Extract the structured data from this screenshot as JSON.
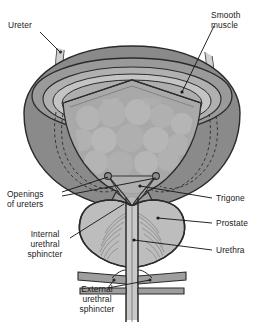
{
  "figure": {
    "style": "grayscale medical illustration",
    "background_color": "#ffffff"
  },
  "colors": {
    "outline": "#2b2b2b",
    "outer_wall": "#8a8a8a",
    "muscle_rim": "#9a9a9a",
    "rim_highlight": "#c4c4c4",
    "mucosa_interior": "#a9a9a9",
    "mucosa_mottle": "#b9b9b9",
    "trigone": "#b0b0b0",
    "prostate_fill": "#bdbdbd",
    "prostate_striation": "#8d8d8d",
    "urethra_lumen": "#c9c9c9",
    "sphincter_band": "#9e9e9e",
    "ureter_tube": "#bfbfbf",
    "label_text": "#1a1a1a",
    "leader_line": "#1a1a1a"
  },
  "labels": [
    {
      "id": "ureter",
      "text": "Ureter",
      "side": "left",
      "x": 8,
      "y": 22,
      "align": "left"
    },
    {
      "id": "smooth-muscle",
      "text": "Smooth\nmuscle",
      "side": "right",
      "x": 212,
      "y": 12,
      "align": "left"
    },
    {
      "id": "openings-of-ureters",
      "text": "Openings\nof ureters",
      "side": "left",
      "x": 8,
      "y": 191,
      "align": "left"
    },
    {
      "id": "trigone",
      "text": "Trigone",
      "side": "right",
      "x": 215,
      "y": 195,
      "align": "left"
    },
    {
      "id": "prostate",
      "text": "Prostate",
      "side": "right",
      "x": 215,
      "y": 220,
      "align": "left"
    },
    {
      "id": "internal-urethral-sphincter",
      "text": "Internal\nurethral\nsphincter",
      "side": "left",
      "x": 18,
      "y": 232,
      "align": "center"
    },
    {
      "id": "urethra",
      "text": "Urethra",
      "side": "right",
      "x": 215,
      "y": 247,
      "align": "left"
    },
    {
      "id": "external-urethral-sphincter",
      "text": "External\nurethral\nsphincter",
      "side": "left",
      "x": 62,
      "y": 283,
      "align": "center"
    }
  ],
  "structures": [
    {
      "id": "bladder-dome",
      "name": "Bladder dome (detrusor wall)"
    },
    {
      "id": "bladder-cutaway-rim",
      "name": "Cut edge of bladder wall"
    },
    {
      "id": "bladder-mucosa",
      "name": "Interior mucosa with rugae"
    },
    {
      "id": "left-ureter",
      "name": "Left ureter"
    },
    {
      "id": "right-ureter",
      "name": "Right ureter"
    },
    {
      "id": "ureteric-orifice-left",
      "name": "Left ureteric orifice"
    },
    {
      "id": "ureteric-orifice-right",
      "name": "Right ureteric orifice"
    },
    {
      "id": "trigone-region",
      "name": "Trigone"
    },
    {
      "id": "bladder-neck",
      "name": "Bladder neck / internal urethral sphincter"
    },
    {
      "id": "prostate-gland",
      "name": "Prostate gland"
    },
    {
      "id": "urethra-tube",
      "name": "Urethra"
    },
    {
      "id": "external-sphincter",
      "name": "External urethral sphincter"
    }
  ]
}
